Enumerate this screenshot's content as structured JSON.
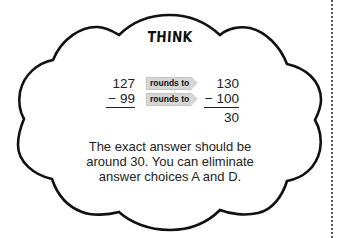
{
  "title": "THINK",
  "rounding": {
    "rows": [
      {
        "original": "127",
        "arrow_label": "rounds to",
        "rounded": "130"
      },
      {
        "original": "− 99",
        "arrow_label": "rounds to",
        "rounded": "− 100"
      }
    ],
    "result": "30"
  },
  "explanation_lines": [
    "The exact answer should be",
    "around 30. You can eliminate",
    "answer choices A and D."
  ],
  "colors": {
    "outline": "#111111",
    "arrow_fill": "#d6d6d6",
    "text": "#222222"
  }
}
